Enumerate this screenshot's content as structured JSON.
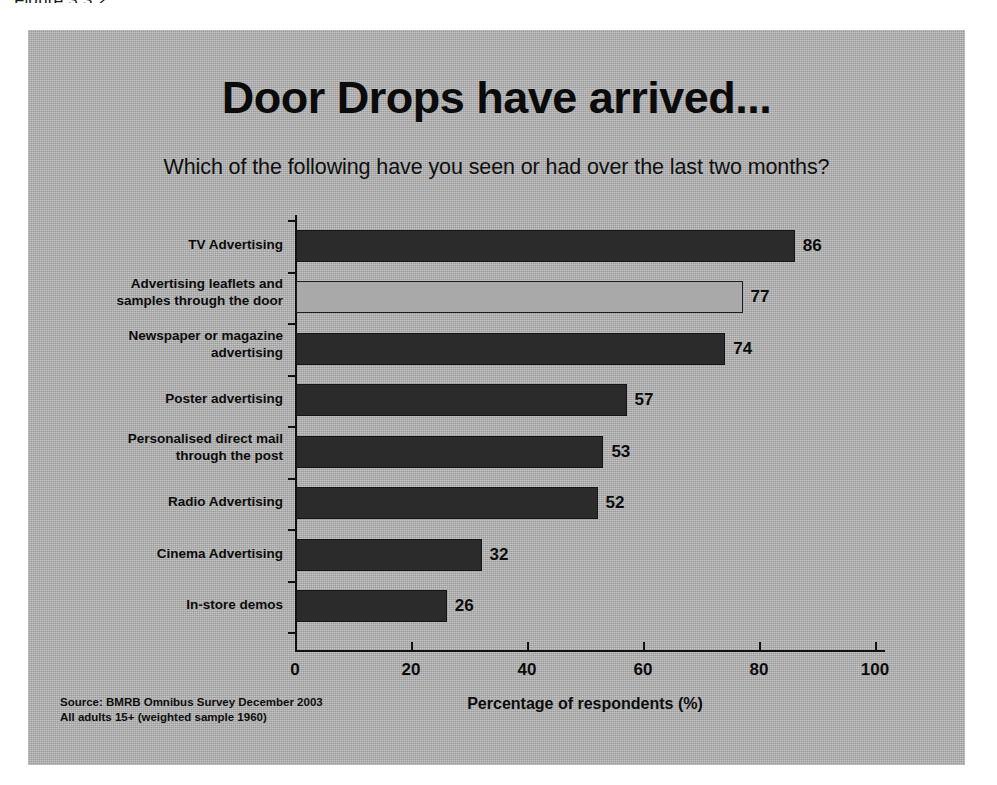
{
  "figure_caption": "Figure 3.3.2",
  "slide": {
    "title": "Door Drops have arrived...",
    "subtitle": "Which of the following have you seen or had over the last two months?",
    "source_line_1": "Source:  BMRB Omnibus Survey December 2003",
    "source_line_2": "All adults 15+ (weighted sample 1960)"
  },
  "colors": {
    "slide_background": "#b2b2b2",
    "bar_dark": "#2b2b2b",
    "bar_highlight": "#a9a9a9",
    "axis": "#111111",
    "text": "#0c0c0c"
  },
  "chart_data": {
    "type": "bar",
    "orientation": "horizontal",
    "title": "Door Drops have arrived...",
    "subtitle": "Which of the following have you seen or had over the last two months?",
    "xlabel": "Percentage of respondents (%)",
    "ylabel": "",
    "xlim": [
      0,
      100
    ],
    "xticks": [
      0,
      20,
      40,
      60,
      80,
      100
    ],
    "xtick_labels": [
      "0",
      "20",
      "40",
      "60",
      "80",
      "100"
    ],
    "grid": false,
    "legend": null,
    "categories": [
      "TV Advertising",
      "Advertising leaflets and samples through the door",
      "Newspaper or magazine advertising",
      "Poster advertising",
      "Personalised direct mail through the post",
      "Radio Advertising",
      "Cinema Advertising",
      "In-store demos"
    ],
    "values": [
      86,
      77,
      74,
      57,
      53,
      52,
      32,
      26
    ],
    "highlighted_index": 1,
    "bars": [
      {
        "label_line_1": "TV Advertising",
        "label_line_2": "",
        "value": 86,
        "value_label": "86",
        "style": "dark"
      },
      {
        "label_line_1": "Advertising leaflets and",
        "label_line_2": "samples through the door",
        "value": 77,
        "value_label": "77",
        "style": "light"
      },
      {
        "label_line_1": "Newspaper or magazine",
        "label_line_2": "advertising",
        "value": 74,
        "value_label": "74",
        "style": "dark"
      },
      {
        "label_line_1": "Poster advertising",
        "label_line_2": "",
        "value": 57,
        "value_label": "57",
        "style": "dark"
      },
      {
        "label_line_1": "Personalised direct mail",
        "label_line_2": "through the post",
        "value": 53,
        "value_label": "53",
        "style": "dark"
      },
      {
        "label_line_1": "Radio Advertising",
        "label_line_2": "",
        "value": 52,
        "value_label": "52",
        "style": "dark"
      },
      {
        "label_line_1": "Cinema Advertising",
        "label_line_2": "",
        "value": 32,
        "value_label": "32",
        "style": "dark"
      },
      {
        "label_line_1": "In-store demos",
        "label_line_2": "",
        "value": 26,
        "value_label": "26",
        "style": "dark"
      }
    ]
  }
}
